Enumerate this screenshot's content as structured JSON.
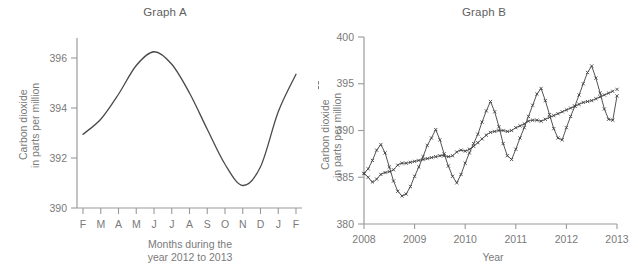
{
  "figure": {
    "panels": [
      {
        "id": "graph-a",
        "title": "Graph A"
      },
      {
        "id": "graph-b",
        "title": "Graph B"
      }
    ]
  },
  "chart_data": [
    {
      "type": "line",
      "title": "Graph A",
      "xlabel": "Months during the year 2012 to 2013",
      "xlabel_lines": [
        "Months during the",
        "year 2012 to 2013"
      ],
      "ylabel": "Carbon dioxide in parts per million",
      "ylabel_lines": [
        "Carbon dioxide",
        "in parts per million"
      ],
      "grid": false,
      "legend": "none",
      "xlim": [
        0,
        12
      ],
      "ylim": [
        390,
        396.8
      ],
      "yticks": [
        390,
        392,
        394,
        396
      ],
      "ytick_labels": [
        "390",
        "392",
        "394",
        "396"
      ],
      "categories": [
        "F",
        "M",
        "A",
        "M",
        "J",
        "J",
        "A",
        "S",
        "O",
        "N",
        "D",
        "J",
        "F"
      ],
      "xtick_labels": [
        "F",
        "M",
        "A",
        "M",
        "J",
        "J",
        "A",
        "S",
        "O",
        "N",
        "D",
        "J",
        "F"
      ],
      "values": [
        392.95,
        393.55,
        394.55,
        395.7,
        396.25,
        395.75,
        394.6,
        393.15,
        391.75,
        390.9,
        391.65,
        393.85,
        395.35
      ],
      "series": [
        {
          "name": "Monthly mean carbon dioxide",
          "values": [
            392.95,
            393.55,
            394.55,
            395.7,
            396.25,
            395.75,
            394.6,
            393.15,
            391.75,
            390.9,
            391.65,
            393.85,
            395.35
          ]
        }
      ],
      "annotations": []
    },
    {
      "type": "line",
      "title": "Graph B",
      "xlabel": "Year",
      "ylabel": "Carbon dioxide in parts per million",
      "ylabel_lines": [
        "Carbon dioxide",
        "in parts per million"
      ],
      "grid": false,
      "legend": "none",
      "xlim": [
        2008,
        2013
      ],
      "ylim": [
        380,
        400
      ],
      "yticks": [
        380,
        385,
        390,
        395,
        400
      ],
      "ytick_labels": [
        "380",
        "385",
        "390",
        "395",
        "400"
      ],
      "xticks": [
        2008,
        2009,
        2010,
        2011,
        2012,
        2013
      ],
      "xtick_labels": [
        "2008",
        "2009",
        "2010",
        "2011",
        "2012",
        "2013"
      ],
      "x": [
        2008.0,
        2008.083,
        2008.167,
        2008.25,
        2008.333,
        2008.417,
        2008.5,
        2008.583,
        2008.667,
        2008.75,
        2008.833,
        2008.917,
        2009.0,
        2009.083,
        2009.167,
        2009.25,
        2009.333,
        2009.417,
        2009.5,
        2009.583,
        2009.667,
        2009.75,
        2009.833,
        2009.917,
        2010.0,
        2010.083,
        2010.167,
        2010.25,
        2010.333,
        2010.417,
        2010.5,
        2010.583,
        2010.667,
        2010.75,
        2010.833,
        2010.917,
        2011.0,
        2011.083,
        2011.167,
        2011.25,
        2011.333,
        2011.417,
        2011.5,
        2011.583,
        2011.667,
        2011.75,
        2011.833,
        2011.917,
        2012.0,
        2012.083,
        2012.167,
        2012.25,
        2012.333,
        2012.417,
        2012.5,
        2012.583,
        2012.667,
        2012.75,
        2012.833,
        2012.917,
        2013.0
      ],
      "series": [
        {
          "name": "Monthly mean carbon dioxide",
          "style": "seasonal-oscillating",
          "values": [
            385.4,
            385.9,
            386.8,
            387.9,
            388.5,
            387.6,
            386.1,
            384.6,
            383.5,
            383.0,
            383.2,
            384.0,
            385.1,
            386.1,
            387.2,
            388.4,
            389.2,
            390.1,
            389.0,
            387.5,
            386.2,
            385.1,
            384.4,
            385.3,
            386.5,
            387.6,
            388.6,
            389.6,
            390.9,
            392.1,
            393.1,
            392.0,
            390.4,
            388.6,
            387.3,
            386.9,
            388.0,
            389.2,
            390.3,
            391.5,
            392.7,
            393.9,
            394.5,
            393.2,
            391.7,
            390.2,
            389.2,
            389.0,
            390.3,
            391.5,
            392.6,
            393.8,
            395.0,
            396.2,
            396.9,
            395.6,
            394.0,
            392.3,
            391.2,
            391.1,
            393.7
          ],
          "markers": true
        },
        {
          "name": "Seasonally adjusted trend",
          "style": "smoothed-trend",
          "values": [
            385.4,
            385.0,
            384.5,
            384.8,
            385.3,
            385.5,
            385.6,
            385.8,
            386.3,
            386.5,
            386.5,
            386.6,
            386.7,
            386.8,
            386.9,
            387.0,
            387.1,
            387.2,
            387.3,
            387.3,
            387.2,
            387.3,
            387.7,
            387.9,
            387.8,
            388.0,
            388.3,
            388.7,
            389.1,
            389.5,
            389.8,
            389.9,
            390.0,
            390.0,
            389.9,
            390.0,
            390.3,
            390.5,
            390.7,
            391.0,
            391.1,
            391.1,
            391.0,
            391.2,
            391.4,
            391.6,
            391.8,
            392.0,
            392.2,
            392.4,
            392.6,
            392.8,
            393.0,
            393.1,
            393.2,
            393.4,
            393.6,
            393.8,
            394.0,
            394.2,
            394.4,
            394.6,
            395.1
          ],
          "markers": true
        }
      ],
      "annotations": []
    }
  ]
}
